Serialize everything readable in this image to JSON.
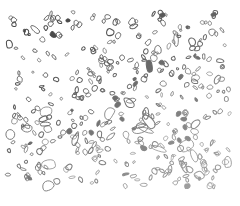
{
  "image": {
    "description": "Line drawing of many irregular rounded blob outlines (cell-like particles) on a white background",
    "width": 240,
    "height": 206,
    "background": "#ffffff",
    "region": {
      "x": 8,
      "y": 12,
      "w": 222,
      "h": 176
    },
    "stroke_dark": "#4a4a4a",
    "stroke_light": "#a8a8a8",
    "blob_count": 420,
    "seed": 7
  }
}
